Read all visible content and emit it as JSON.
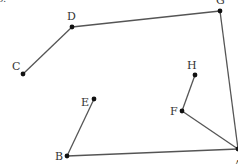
{
  "caption_fragment": "B.",
  "points": [
    {
      "id": "C",
      "label": "C",
      "x": 23,
      "y": 74,
      "lx": 12,
      "ly": 70
    },
    {
      "id": "D",
      "label": "D",
      "x": 72,
      "y": 27,
      "lx": 67,
      "ly": 20
    },
    {
      "id": "G",
      "label": "G",
      "x": 220,
      "y": 11,
      "lx": 216,
      "ly": 4
    },
    {
      "id": "H",
      "label": "H",
      "x": 195,
      "y": 75,
      "lx": 187,
      "ly": 69
    },
    {
      "id": "F",
      "label": "F",
      "x": 182,
      "y": 111,
      "lx": 170,
      "ly": 115
    },
    {
      "id": "E",
      "label": "E",
      "x": 94,
      "y": 99,
      "lx": 81,
      "ly": 106
    },
    {
      "id": "B",
      "label": "B",
      "x": 67,
      "y": 156,
      "lx": 55,
      "ly": 160
    },
    {
      "id": "A",
      "label": "A",
      "x": 238,
      "y": 149,
      "lx": 234,
      "ly": 168
    }
  ],
  "segments": [
    [
      "C",
      "D"
    ],
    [
      "D",
      "G"
    ],
    [
      "G",
      "A"
    ],
    [
      "H",
      "F"
    ],
    [
      "F",
      "A"
    ],
    [
      "E",
      "B"
    ],
    [
      "B",
      "A"
    ]
  ]
}
